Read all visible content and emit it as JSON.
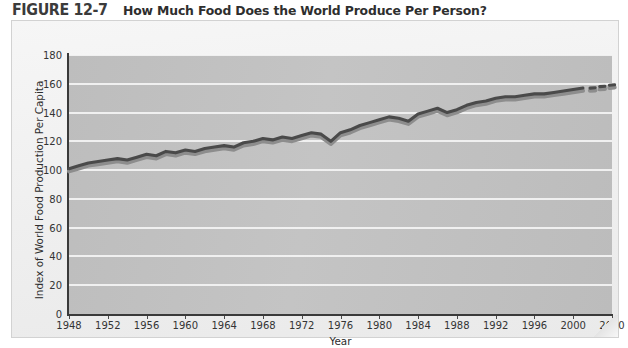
{
  "figure": {
    "number": "FIGURE 12-7",
    "title": "How Much Food Does the World Produce Per Person?"
  },
  "chart_data": {
    "type": "line",
    "title": "How Much Food Does the World Produce Per Person?",
    "xlabel": "Year",
    "ylabel": "Index of World Food Production Per Capita",
    "xlim": [
      1948,
      2004
    ],
    "ylim": [
      0,
      180
    ],
    "grid": true,
    "legend": null,
    "x_tick_labels": [
      "1948",
      "1952",
      "1956",
      "1960",
      "1964",
      "1968",
      "1972",
      "1976",
      "1980",
      "1984",
      "1988",
      "1992",
      "1996",
      "2000",
      "2010"
    ],
    "x_tick_values": [
      1948,
      1952,
      1956,
      1960,
      1964,
      1968,
      1972,
      1976,
      1980,
      1984,
      1988,
      1992,
      1996,
      2000,
      2004
    ],
    "y_tick_labels": [
      "0",
      "20",
      "40",
      "60",
      "80",
      "100",
      "120",
      "140",
      "160",
      "180"
    ],
    "y_tick_values": [
      0,
      20,
      40,
      60,
      80,
      100,
      120,
      140,
      160,
      180
    ],
    "line_color": "#4a4a4a",
    "shadow_color": "#8d8d8d",
    "plot_background": "#c0c0c0",
    "gridline_color": "#f4f4f4",
    "series": [
      {
        "name": "Index of World Food Production Per Capita",
        "x": [
          1948,
          1949,
          1950,
          1951,
          1952,
          1953,
          1954,
          1955,
          1956,
          1957,
          1958,
          1959,
          1960,
          1961,
          1962,
          1963,
          1964,
          1965,
          1966,
          1967,
          1968,
          1969,
          1970,
          1971,
          1972,
          1973,
          1974,
          1975,
          1976,
          1977,
          1978,
          1979,
          1980,
          1981,
          1982,
          1983,
          1984,
          1985,
          1986,
          1987,
          1988,
          1989,
          1990,
          1991,
          1992,
          1993,
          1994,
          1995,
          1996,
          1997,
          1998,
          1999,
          2000,
          2001
        ],
        "values": [
          101,
          103,
          105,
          106,
          107,
          108,
          107,
          109,
          111,
          110,
          113,
          112,
          114,
          113,
          115,
          116,
          117,
          116,
          119,
          120,
          122,
          121,
          123,
          122,
          124,
          126,
          125,
          120,
          126,
          128,
          131,
          133,
          135,
          137,
          136,
          134,
          139,
          141,
          143,
          140,
          142,
          145,
          147,
          148,
          150,
          151,
          151,
          152,
          153,
          153,
          154,
          155,
          156,
          157
        ],
        "style": "solid"
      },
      {
        "name": "Projection",
        "x": [
          2002,
          2003,
          2004
        ],
        "values": [
          157,
          158,
          159
        ],
        "style": "dashed"
      }
    ]
  }
}
